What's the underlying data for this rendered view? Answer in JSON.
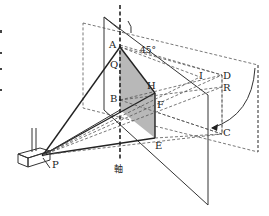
{
  "diagram": {
    "points": {
      "A": "A",
      "B": "B",
      "C": "C",
      "D": "D",
      "E": "E",
      "F": "F",
      "H": "H",
      "I": "I",
      "Q": "Q",
      "R": "R",
      "P": "P"
    },
    "angle_label": "45°",
    "axis_label": "軸",
    "colors": {
      "line": "#333333",
      "shade": "#b8b8b8"
    }
  }
}
